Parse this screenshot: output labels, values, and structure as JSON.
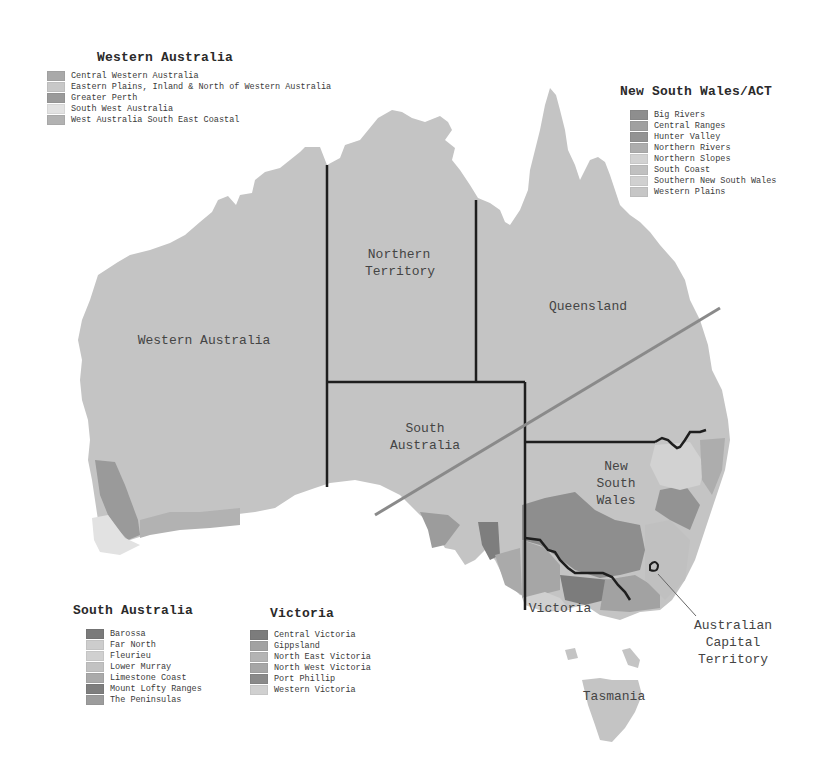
{
  "map": {
    "land_color": "#c4c4c4",
    "border_color": "#1e1e1e",
    "diagonal_line_color": "#8a8a8a",
    "state_labels": {
      "western_australia": "Western Australia",
      "northern_territory_line1": "Northern",
      "northern_territory_line2": "Territory",
      "queensland": "Queensland",
      "south_australia_line1": "South",
      "south_australia_line2": "Australia",
      "nsw_line1": "New",
      "nsw_line2": "South",
      "nsw_line3": "Wales",
      "victoria": "Victoria",
      "tasmania": "Tasmania",
      "act_line1": "Australian",
      "act_line2": "Capital",
      "act_line3": "Territory"
    }
  },
  "legends": {
    "western_australia": {
      "title": "Western Australia",
      "items": [
        {
          "label": "Central Western Australia",
          "color": "#a9a9a9"
        },
        {
          "label": "Eastern Plains, Inland & North of Western Australia",
          "color": "#c8c8c8"
        },
        {
          "label": "Greater Perth",
          "color": "#9a9a9a"
        },
        {
          "label": "South West Australia",
          "color": "#e2e2e2"
        },
        {
          "label": "West Australia South East Coastal",
          "color": "#b2b2b2"
        }
      ]
    },
    "nsw_act": {
      "title": "New South Wales/ACT",
      "items": [
        {
          "label": "Big Rivers",
          "color": "#8e8e8e"
        },
        {
          "label": "Central Ranges",
          "color": "#a0a0a0"
        },
        {
          "label": "Hunter Valley",
          "color": "#939393"
        },
        {
          "label": "Northern Rivers",
          "color": "#adadad"
        },
        {
          "label": "Northern Slopes",
          "color": "#d2d2d2"
        },
        {
          "label": "South Coast",
          "color": "#c0c0c0"
        },
        {
          "label": "Southern New South Wales",
          "color": "#d0d0d0"
        },
        {
          "label": "Western Plains",
          "color": "#c6c6c6"
        }
      ]
    },
    "south_australia": {
      "title": "South Australia",
      "items": [
        {
          "label": "Barossa",
          "color": "#7a7a7a"
        },
        {
          "label": "Far North",
          "color": "#cdcdcd"
        },
        {
          "label": "Fleurieu",
          "color": "#d0d0d0"
        },
        {
          "label": "Lower Murray",
          "color": "#c2c2c2"
        },
        {
          "label": "Limestone Coast",
          "color": "#aaaaaa"
        },
        {
          "label": "Mount Lofty Ranges",
          "color": "#7e7e7e"
        },
        {
          "label": "The Peninsulas",
          "color": "#9c9c9c"
        }
      ]
    },
    "victoria": {
      "title": "Victoria",
      "items": [
        {
          "label": "Central Victoria",
          "color": "#7c7c7c"
        },
        {
          "label": "Gippsland",
          "color": "#a2a2a2"
        },
        {
          "label": "North East Victoria",
          "color": "#b4b4b4"
        },
        {
          "label": "North West Victoria",
          "color": "#a6a6a6"
        },
        {
          "label": "Port Phillip",
          "color": "#8a8a8a"
        },
        {
          "label": "Western Victoria",
          "color": "#d0d0d0"
        }
      ]
    }
  }
}
